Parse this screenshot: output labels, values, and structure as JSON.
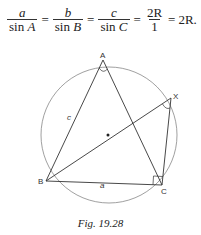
{
  "equation": {
    "terms": [
      {
        "num": "a",
        "den_fn": "sin",
        "den_var": "A"
      },
      {
        "num": "b",
        "den_fn": "sin",
        "den_var": "B"
      },
      {
        "num": "c",
        "den_fn": "sin",
        "den_var": "C"
      },
      {
        "num": "2R",
        "den_plain": "1"
      }
    ],
    "equals": "=",
    "result": "2R."
  },
  "figure": {
    "points": {
      "A": {
        "label": "A",
        "x": 103,
        "y": 60
      },
      "B": {
        "label": "B",
        "x": 46,
        "y": 181
      },
      "C": {
        "label": "C",
        "x": 162,
        "y": 185
      },
      "X": {
        "label": "X",
        "x": 171,
        "y": 98
      },
      "O": {
        "x": 108,
        "y": 135
      }
    },
    "circle": {
      "cx": 109,
      "cy": 135,
      "r": 68
    },
    "side_labels": {
      "c": "c",
      "a": "a"
    },
    "stroke_color": "#333333",
    "circle_color": "#777777"
  },
  "caption": "Fig. 19.28"
}
